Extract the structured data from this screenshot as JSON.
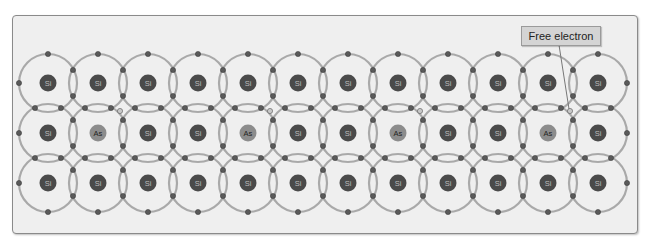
{
  "diagram": {
    "type": "crystal-lattice",
    "label": "Free electron",
    "grid": {
      "cols": 12,
      "rows": 3,
      "origin_x": 48,
      "origin_y": 83,
      "spacing": 50,
      "orbit_radius": 29
    },
    "rows": [
      [
        "Si",
        "Si",
        "Si",
        "Si",
        "Si",
        "Si",
        "Si",
        "Si",
        "Si",
        "Si",
        "Si",
        "Si"
      ],
      [
        "Si",
        "As",
        "Si",
        "Si",
        "As",
        "Si",
        "Si",
        "As",
        "Si",
        "Si",
        "As",
        "Si"
      ],
      [
        "Si",
        "Si",
        "Si",
        "Si",
        "Si",
        "Si",
        "Si",
        "Si",
        "Si",
        "Si",
        "Si",
        "Si"
      ]
    ],
    "free_electrons": [
      {
        "col": 1,
        "row": 1
      },
      {
        "col": 4,
        "row": 1
      },
      {
        "col": 7,
        "row": 1
      },
      {
        "col": 10,
        "row": 1
      }
    ],
    "annotated_free_electron": {
      "col": 10,
      "row": 1
    },
    "colors": {
      "si_nucleus": "#4a4a4a",
      "as_nucleus": "#8c8c8c",
      "orbit": "#a9a9a9",
      "electron": "#5a5a5a",
      "free_electron": "#c8c8c8",
      "background": "#efefef"
    }
  }
}
